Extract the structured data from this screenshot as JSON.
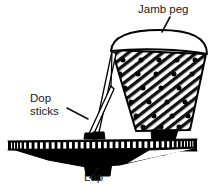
{
  "figure": {
    "title_visible": false,
    "background_color": "#ffffff",
    "line_color": "#000000",
    "labels": [
      {
        "id": "jamb-peg",
        "text": "Jamb peg",
        "lines": [
          "Jamb peg"
        ],
        "x": 138,
        "y": 13,
        "anchor": "start",
        "leader": {
          "x1": 170,
          "y1": 17,
          "x2": 162,
          "y2": 32
        }
      },
      {
        "id": "dop-sticks",
        "text": "Dop sticks",
        "lines": [
          "Dop",
          "sticks"
        ],
        "x": 30,
        "y": 102,
        "anchor": "start",
        "leader": {
          "x1": 67,
          "y1": 108,
          "x2": 88,
          "y2": 119
        }
      },
      {
        "id": "lap",
        "text": "Lap",
        "lines": [
          "Lap"
        ],
        "x": 84,
        "y": 181,
        "anchor": "start",
        "leader": {
          "x1": 98,
          "y1": 168,
          "x2": 90,
          "y2": 178
        }
      }
    ],
    "parts": {
      "jamb_peg": {
        "name": "Jamb peg",
        "shape": "inverted truncated cone",
        "fill_pattern": "diagonal hatching with dot grid",
        "top_cap": "rounded white dome",
        "foot": "black square stem",
        "rim_left_x": 112,
        "rim_left_y": 52
      },
      "dop_sticks": {
        "name": "Dop sticks",
        "count": 2,
        "shape": "thin tapered rods",
        "from": "jamb peg left rim",
        "to": "lap surface"
      },
      "lap": {
        "name": "Lap",
        "shape": "flat horizontal disk seen edge-on",
        "top_edge": "serrated striped band",
        "underside": "solid black cone",
        "foot": "black square stem"
      }
    }
  }
}
